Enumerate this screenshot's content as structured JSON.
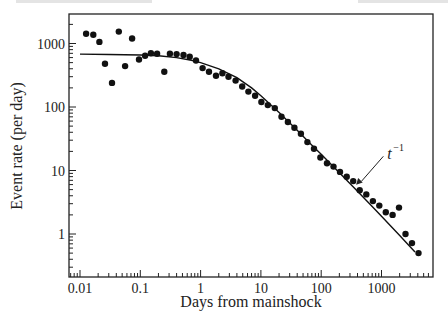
{
  "chart_data": {
    "type": "scatter",
    "title": "",
    "xlabel": "Days from mainshock",
    "ylabel": "Event rate (per day)",
    "xscale": "log",
    "yscale": "log",
    "xlim": [
      0.0067,
      5500
    ],
    "ylim": [
      0.21,
      2600
    ],
    "grid": false,
    "legend": null,
    "x_ticks": [
      0.01,
      0.1,
      1,
      10,
      100,
      1000
    ],
    "x_tick_labels": [
      "0.01",
      "0.1",
      "1",
      "10",
      "100",
      "1000"
    ],
    "y_ticks": [
      1,
      10,
      100,
      1000
    ],
    "y_tick_labels": [
      "1",
      "10",
      "100",
      "1000"
    ],
    "series": [
      {
        "name": "observed event rate",
        "style": "points",
        "x": [
          0.0126,
          0.0166,
          0.021,
          0.026,
          0.034,
          0.044,
          0.056,
          0.073,
          0.095,
          0.12,
          0.15,
          0.19,
          0.25,
          0.31,
          0.4,
          0.52,
          0.66,
          0.84,
          1.08,
          1.38,
          1.8,
          2.3,
          2.9,
          3.8,
          4.9,
          6.2,
          8.0,
          10.2,
          13,
          17,
          22,
          28,
          36,
          46,
          59,
          76,
          97,
          125,
          160,
          205,
          265,
          340,
          435,
          560,
          720,
          920,
          1180,
          1530,
          1950,
          2500,
          3200,
          4100
        ],
        "y": [
          1420,
          1370,
          1060,
          480,
          240,
          1540,
          440,
          1200,
          560,
          640,
          700,
          690,
          360,
          690,
          680,
          660,
          620,
          540,
          410,
          360,
          310,
          340,
          300,
          260,
          210,
          175,
          150,
          120,
          107,
          96,
          70,
          58,
          47,
          38,
          28,
          22,
          16,
          13,
          11.5,
          9.5,
          8,
          6.8,
          4.9,
          4.2,
          3.3,
          2.8,
          2.2,
          2.0,
          2.6,
          1.0,
          0.72,
          0.5
        ]
      },
      {
        "name": "model fit",
        "style": "line",
        "x": [
          0.01,
          0.03,
          0.1,
          0.2,
          0.4,
          0.7,
          1,
          2,
          4,
          7,
          10,
          20,
          40,
          70,
          100,
          200,
          400,
          700,
          1000,
          2000,
          3600
        ],
        "y": [
          680,
          672,
          660,
          640,
          600,
          545,
          500,
          400,
          290,
          200,
          150,
          82,
          43,
          25,
          18,
          9.2,
          4.7,
          2.7,
          1.9,
          0.95,
          0.52
        ]
      }
    ],
    "annotations": [
      {
        "text": "t",
        "superscript": "−1",
        "x": 1250,
        "y": 15,
        "arrow_to": [
          400,
          6.3
        ]
      }
    ]
  }
}
